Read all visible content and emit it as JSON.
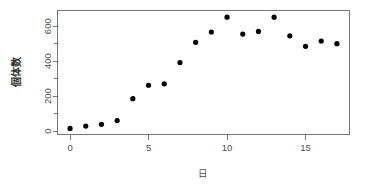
{
  "chart_data": {
    "type": "scatter",
    "title": "",
    "xlabel": "日",
    "ylabel": "個体数",
    "x": [
      0,
      1,
      2,
      3,
      4,
      5,
      6,
      7,
      8,
      9,
      10,
      11,
      12,
      13,
      14,
      15,
      16,
      17
    ],
    "values": [
      15,
      28,
      38,
      60,
      185,
      262,
      270,
      392,
      508,
      567,
      652,
      555,
      570,
      652,
      545,
      485,
      515,
      500
    ],
    "series": [
      {
        "name": "個体数",
        "values": [
          15,
          28,
          38,
          60,
          185,
          262,
          270,
          392,
          508,
          567,
          652,
          555,
          570,
          652,
          545,
          485,
          515,
          500
        ]
      }
    ],
    "xlim": [
      -0.8,
      17.8
    ],
    "ylim": [
      -20,
      690
    ],
    "x_ticks": [
      0,
      5,
      10,
      15
    ],
    "x_tick_labels": [
      "0",
      "5",
      "10",
      "15"
    ],
    "y_ticks": [
      0,
      100,
      200,
      300,
      400,
      500,
      600
    ],
    "y_tick_labels": [
      "0",
      "",
      "200",
      "",
      "400",
      "",
      "600"
    ],
    "y_major_ticks": [
      0,
      200,
      400,
      600
    ],
    "grid": false,
    "legend": false,
    "marker": "filled-circle",
    "marker_color": "#000000",
    "axis_color": "#666666",
    "frame": true
  },
  "figure": {
    "background": "#ffffff",
    "y_axis_title": "個体数",
    "x_axis_title": "日"
  }
}
